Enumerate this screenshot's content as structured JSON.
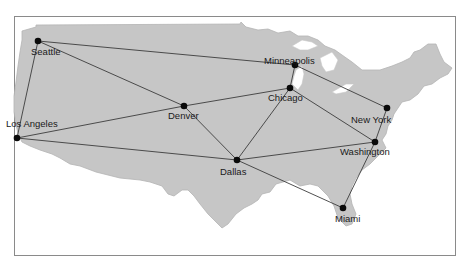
{
  "map": {
    "type": "network-map",
    "region": "United States",
    "colors": {
      "land": "#c6c6c6",
      "water": "#ffffff",
      "route": "#3c3c3c",
      "node": "#0a0a0a",
      "frame": "#8a8a8a"
    },
    "cities": [
      {
        "id": "seattle",
        "label": "Seattle",
        "x": 38,
        "y": 41,
        "label_x": 31,
        "label_y": 47
      },
      {
        "id": "los_angeles",
        "label": "Los Angeles",
        "x": 17,
        "y": 138,
        "label_x": 6,
        "label_y": 119
      },
      {
        "id": "denver",
        "label": "Denver",
        "x": 184,
        "y": 106,
        "label_x": 168,
        "label_y": 111
      },
      {
        "id": "minneapolis",
        "label": "Minneapolis",
        "x": 295,
        "y": 65,
        "label_x": 264,
        "label_y": 56
      },
      {
        "id": "chicago",
        "label": "Chicago",
        "x": 290,
        "y": 88,
        "label_x": 268,
        "label_y": 93
      },
      {
        "id": "dallas",
        "label": "Dallas",
        "x": 237,
        "y": 160,
        "label_x": 220,
        "label_y": 167
      },
      {
        "id": "new_york",
        "label": "New York",
        "x": 387,
        "y": 108,
        "label_x": 351,
        "label_y": 115
      },
      {
        "id": "washington",
        "label": "Washington",
        "x": 375,
        "y": 142,
        "label_x": 340,
        "label_y": 147
      },
      {
        "id": "miami",
        "label": "Miami",
        "x": 343,
        "y": 208,
        "label_x": 335,
        "label_y": 214
      }
    ],
    "routes": [
      [
        "seattle",
        "minneapolis"
      ],
      [
        "seattle",
        "denver"
      ],
      [
        "seattle",
        "los_angeles"
      ],
      [
        "los_angeles",
        "denver"
      ],
      [
        "los_angeles",
        "dallas"
      ],
      [
        "denver",
        "chicago"
      ],
      [
        "denver",
        "dallas"
      ],
      [
        "minneapolis",
        "chicago"
      ],
      [
        "minneapolis",
        "new_york"
      ],
      [
        "chicago",
        "dallas"
      ],
      [
        "chicago",
        "washington"
      ],
      [
        "dallas",
        "washington"
      ],
      [
        "dallas",
        "miami"
      ],
      [
        "new_york",
        "washington"
      ],
      [
        "washington",
        "miami"
      ]
    ]
  }
}
